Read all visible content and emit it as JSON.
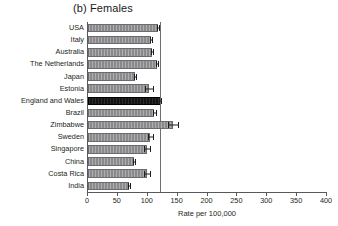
{
  "chart_data": {
    "type": "bar",
    "orientation": "horizontal",
    "title": "(b) Females",
    "xlabel": "Rate per 100,000",
    "ylabel": "",
    "xlim": [
      0,
      400
    ],
    "xticks": [
      0,
      50,
      100,
      150,
      200,
      250,
      300,
      350,
      400
    ],
    "xtick_labels": [
      "0",
      "50",
      "100",
      "150",
      "200",
      "250",
      "300",
      "350",
      "400"
    ],
    "grid": false,
    "legend": "none",
    "reference_line": 120,
    "categories": [
      "USA",
      "Italy",
      "Australia",
      "The Netherlands",
      "Japan",
      "Estonia",
      "England and Wales",
      "Brazil",
      "Zimbabwe",
      "Sweden",
      "Singapore",
      "China",
      "Costa Rica",
      "India"
    ],
    "values": [
      117,
      105,
      107,
      115,
      79,
      102,
      120,
      111,
      142,
      104,
      99,
      77,
      99,
      69
    ],
    "error_low": [
      115,
      103,
      105,
      113,
      77,
      96,
      118,
      108,
      134,
      100,
      94,
      75,
      94,
      67
    ],
    "error_high": [
      119,
      107,
      109,
      117,
      81,
      108,
      122,
      114,
      150,
      108,
      104,
      79,
      104,
      71
    ],
    "highlight_category": "England and Wales",
    "colors": {
      "bar": "#8a8a8c",
      "bar_highlight": "#141414",
      "axis": "#59595b",
      "reference_line": "#6e6e70",
      "text": "#231f20",
      "error_bar": "#1d1d1d",
      "background": "#ffffff"
    }
  }
}
